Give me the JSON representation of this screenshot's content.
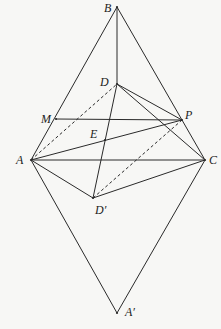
{
  "diagram": {
    "type": "geometry-figure",
    "points": [
      {
        "id": "B",
        "label": "B",
        "x": 117,
        "y": 7,
        "lx": 104,
        "ly": 12
      },
      {
        "id": "D",
        "label": "D",
        "x": 117,
        "y": 84,
        "lx": 100,
        "ly": 86
      },
      {
        "id": "M",
        "label": "M",
        "x": 56,
        "y": 119,
        "lx": 41,
        "ly": 123
      },
      {
        "id": "P",
        "label": "P",
        "x": 182,
        "y": 120,
        "lx": 185,
        "ly": 119
      },
      {
        "id": "E",
        "label": "E",
        "x": 105,
        "y": 140,
        "lx": 90,
        "ly": 138
      },
      {
        "id": "A",
        "label": "A",
        "x": 31,
        "y": 160,
        "lx": 16,
        "ly": 164
      },
      {
        "id": "C",
        "label": "C",
        "x": 205,
        "y": 160,
        "lx": 209,
        "ly": 164
      },
      {
        "id": "D'",
        "label": "D′",
        "x": 93,
        "y": 198,
        "lx": 95,
        "ly": 214
      },
      {
        "id": "A'",
        "label": "A′",
        "x": 117,
        "y": 313,
        "lx": 125,
        "ly": 316
      }
    ],
    "segments": [
      {
        "from": "B",
        "to": "A",
        "style": "solid"
      },
      {
        "from": "B",
        "to": "C",
        "style": "solid"
      },
      {
        "from": "B",
        "to": "D",
        "style": "solid"
      },
      {
        "from": "M",
        "to": "P",
        "style": "solid"
      },
      {
        "from": "A",
        "to": "P",
        "style": "solid"
      },
      {
        "from": "A",
        "to": "C",
        "style": "solid"
      },
      {
        "from": "A",
        "to": "D'",
        "style": "solid"
      },
      {
        "from": "D'",
        "to": "C",
        "style": "solid"
      },
      {
        "from": "D",
        "to": "D'",
        "style": "solid"
      },
      {
        "from": "D",
        "to": "P",
        "style": "solid"
      },
      {
        "from": "D",
        "to": "C",
        "style": "solid"
      },
      {
        "from": "A",
        "to": "A'",
        "style": "solid"
      },
      {
        "from": "C",
        "to": "A'",
        "style": "solid"
      },
      {
        "from": "A",
        "to": "D",
        "style": "dashed"
      },
      {
        "from": "D'",
        "to": "P",
        "style": "dashed"
      }
    ]
  }
}
